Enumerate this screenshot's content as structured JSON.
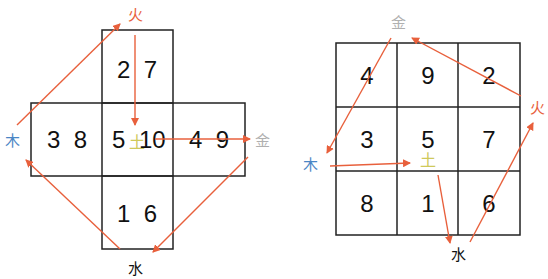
{
  "colors": {
    "arrow": "#e8603c",
    "fire": "#e8603c",
    "wood": "#4a86c5",
    "metal": "#b0b0b0",
    "water": "#111111",
    "earth": "#cfc95a",
    "grid": "#222222"
  },
  "left_diagram": {
    "name": "He Tu (River Chart) cross layout",
    "cells": {
      "top": "2  7",
      "left": "3  8",
      "center_left": "5",
      "center_earth": "土",
      "center_right": "10",
      "right": "4  9",
      "bottom": "1  6"
    },
    "labels": {
      "top": "火",
      "left": "木",
      "right": "金",
      "bottom": "水"
    }
  },
  "right_diagram": {
    "name": "Luo Shu (Lo Shu) 3x3 magic square",
    "grid": [
      [
        "4",
        "9",
        "2"
      ],
      [
        "3",
        "5",
        "7"
      ],
      [
        "8",
        "1",
        "6"
      ]
    ],
    "center_earth": "土",
    "labels": {
      "top": "金",
      "right": "火",
      "left": "木",
      "bottom": "水"
    }
  }
}
